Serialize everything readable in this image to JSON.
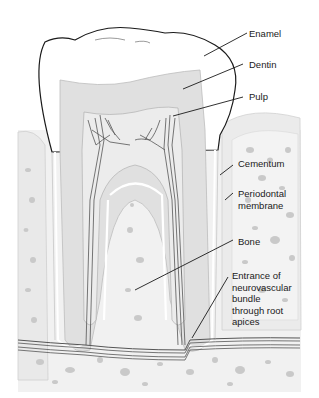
{
  "labels": {
    "enamel": "Enamel",
    "dentin": "Dentin",
    "pulp": "Pulp",
    "cementum": "Cementum",
    "periodontal": "Periodontal\nmembrane",
    "bone": "Bone",
    "entrance": "Entrance of\nneurovascular\nbundle\nthrough root\napices"
  },
  "colors": {
    "enamel": "#ffffff",
    "dentin": "#e0e0e0",
    "pulp": "#ececec",
    "bone": "#f0f0f0",
    "bone_spots": "#c8c8c8",
    "nerve": "#555555",
    "outline": "#1a1a1a"
  }
}
